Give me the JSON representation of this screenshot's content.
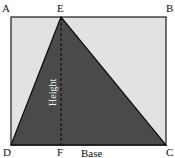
{
  "diagram": {
    "type": "geometry-triangle-in-rectangle",
    "colors": {
      "background": "#ffffff",
      "rectangle_fill": "#e2e2e2",
      "triangle_fill": "#4a4a4a",
      "stroke": "#1a1a1a",
      "height_label": "#f2f2f2"
    },
    "points": {
      "A": {
        "label": "A",
        "x": 11,
        "y": 17
      },
      "B": {
        "label": "B",
        "x": 166,
        "y": 17
      },
      "C": {
        "label": "C",
        "x": 166,
        "y": 145
      },
      "D": {
        "label": "D",
        "x": 11,
        "y": 145
      },
      "E": {
        "label": "E",
        "x": 61,
        "y": 17
      },
      "F": {
        "label": "F",
        "x": 61,
        "y": 145
      }
    },
    "labels": {
      "height": "Height",
      "base": "Base"
    }
  }
}
